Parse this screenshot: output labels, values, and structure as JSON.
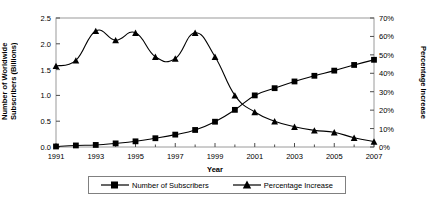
{
  "chart_data": {
    "type": "line",
    "title": "",
    "xlabel": "Year",
    "ylabel": "Number of Worldwide Subscribers (Billions)",
    "ylabel_right": "Percentage Increase",
    "x": [
      1991,
      1992,
      1993,
      1994,
      1995,
      1996,
      1997,
      1998,
      1999,
      2000,
      2001,
      2002,
      2003,
      2004,
      2005,
      2006,
      2007
    ],
    "xlim": [
      1991,
      2007
    ],
    "xticks": [
      1991,
      1993,
      1995,
      1997,
      1999,
      2001,
      2003,
      2005,
      2007
    ],
    "xticklabels": [
      "1991",
      "1993",
      "1995",
      "1997",
      "1999",
      "2001",
      "2003",
      "2005",
      "2007"
    ],
    "ylim": [
      0,
      2.5
    ],
    "yticks": [
      0,
      0.5,
      1.0,
      1.5,
      2.0,
      2.5
    ],
    "yticklabels": [
      "0.0",
      "0.5",
      "1.0",
      "1.5",
      "2.0",
      "2.5"
    ],
    "ylim_right": [
      0,
      70
    ],
    "yticks_right": [
      0,
      10,
      20,
      30,
      40,
      50,
      60,
      70
    ],
    "yticklabels_right": [
      "0%",
      "10%",
      "20%",
      "30%",
      "40%",
      "50%",
      "60%",
      "70%"
    ],
    "grid": false,
    "legend_position": "bottom",
    "series": [
      {
        "name": "Number of Subscribers",
        "axis": "left",
        "marker": "square",
        "color": "#000000",
        "values": [
          0.01,
          0.03,
          0.04,
          0.07,
          0.11,
          0.17,
          0.24,
          0.33,
          0.49,
          0.72,
          1.0,
          1.14,
          1.27,
          1.38,
          1.48,
          1.59,
          1.69
        ]
      },
      {
        "name": "Percentage Increase",
        "axis": "right",
        "marker": "triangle",
        "color": "#000000",
        "values": [
          44,
          47,
          63,
          58,
          62,
          49,
          48,
          62,
          49,
          28,
          19,
          14,
          11,
          9,
          8,
          5,
          3
        ]
      }
    ]
  },
  "legend": {
    "items": [
      {
        "label": "Number of Subscribers",
        "marker": "square-marker-icon"
      },
      {
        "label": "Percentage Increase",
        "marker": "triangle-marker-icon"
      }
    ]
  }
}
